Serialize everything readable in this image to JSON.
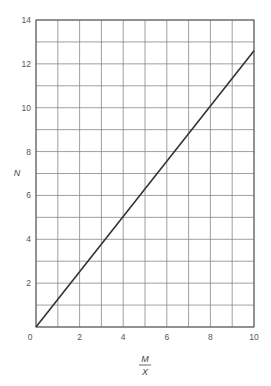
{
  "chart_data": {
    "type": "line",
    "title": "",
    "xlabel": "M/X",
    "xlabel_numerator": "M",
    "xlabel_denominator": "X",
    "ylabel": "N",
    "xlim": [
      0,
      10
    ],
    "ylim": [
      0,
      14
    ],
    "xticks": [
      0,
      2,
      4,
      6,
      8,
      10
    ],
    "yticks": [
      2,
      4,
      6,
      8,
      10,
      12,
      14
    ],
    "x_origin_label": "0",
    "grid": true,
    "grid_x_step": 1,
    "grid_y_step": 1,
    "legend": null,
    "series": [
      {
        "name": "N",
        "x": [
          0,
          10
        ],
        "y": [
          0,
          12.6
        ],
        "color": "#333333"
      }
    ]
  },
  "colors": {
    "grid": "#888888",
    "line": "#333333",
    "text": "#555555"
  }
}
